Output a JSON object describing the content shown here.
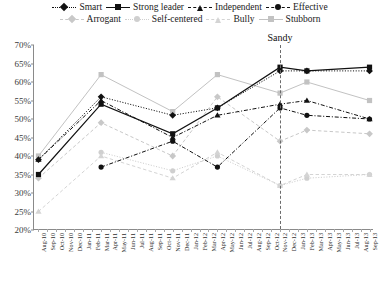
{
  "legend": {
    "rows": [
      [
        {
          "label": "Smart",
          "key": "smart"
        },
        {
          "label": "Strong leader",
          "key": "strong_leader"
        },
        {
          "label": "Independent",
          "key": "independent"
        },
        {
          "label": "Effective",
          "key": "effective"
        }
      ],
      [
        {
          "label": "Arrogant",
          "key": "arrogant"
        },
        {
          "label": "Self-centered",
          "key": "self_centered"
        },
        {
          "label": "Bully",
          "key": "bully"
        },
        {
          "label": "Stubborn",
          "key": "stubborn"
        }
      ]
    ]
  },
  "annotations": [
    {
      "name": "sandy-event",
      "label": "Sandy",
      "x_category": "Nov-12"
    }
  ],
  "chart_data": {
    "type": "line",
    "title": "",
    "xlabel": "",
    "ylabel": "",
    "ylim": [
      20,
      70
    ],
    "ytick_step": 5,
    "ytick_labels": [
      "20%",
      "25%",
      "30%",
      "35%",
      "40%",
      "45%",
      "50%",
      "55%",
      "60%",
      "65%",
      "70%"
    ],
    "grid": false,
    "legend_position": "top",
    "categories": [
      "Aug-10",
      "Sep-10",
      "Oct-10",
      "Nov-10",
      "Dec-10",
      "Jan-11",
      "Feb-11",
      "Mar-11",
      "Apr-11",
      "May-11",
      "Jun-11",
      "Jul-11",
      "Aug-11",
      "Sep-11",
      "Oct-11",
      "Nov-11",
      "Dec-11",
      "Jan-12",
      "Feb-12",
      "Mar-12",
      "Apr-12",
      "May-12",
      "Jun-12",
      "Jul-12",
      "Aug-12",
      "Sep-12",
      "Oct-12",
      "Nov-12",
      "Dec-12",
      "Jan-13",
      "Feb-13",
      "Mar-13",
      "Apr-13",
      "May-13",
      "Jun-13",
      "Jul-13",
      "Aug-13",
      "Sep-13"
    ],
    "series": [
      {
        "name": "Smart",
        "key": "smart",
        "color": "#111111",
        "marker": "diamond",
        "dash": "dotted",
        "width": 1,
        "points": [
          {
            "x": "Aug-10",
            "y": 39
          },
          {
            "x": "Mar-11",
            "y": 56
          },
          {
            "x": "Nov-11",
            "y": 51
          },
          {
            "x": "Apr-12",
            "y": 53
          },
          {
            "x": "Nov-12",
            "y": 63
          },
          {
            "x": "Feb-13",
            "y": 63
          },
          {
            "x": "Sep-13",
            "y": 63
          }
        ]
      },
      {
        "name": "Strong leader",
        "key": "strong_leader",
        "color": "#111111",
        "marker": "square",
        "dash": "solid",
        "width": 1.2,
        "points": [
          {
            "x": "Aug-10",
            "y": 35
          },
          {
            "x": "Mar-11",
            "y": 54
          },
          {
            "x": "Nov-11",
            "y": 46
          },
          {
            "x": "Apr-12",
            "y": 53
          },
          {
            "x": "Nov-12",
            "y": 64
          },
          {
            "x": "Feb-13",
            "y": 63
          },
          {
            "x": "Sep-13",
            "y": 64
          }
        ]
      },
      {
        "name": "Independent",
        "key": "independent",
        "color": "#111111",
        "marker": "triangle",
        "dash": "dashdot",
        "width": 1,
        "points": [
          {
            "x": "Aug-10",
            "y": 39
          },
          {
            "x": "Mar-11",
            "y": 55
          },
          {
            "x": "Nov-11",
            "y": 45
          },
          {
            "x": "Apr-12",
            "y": 51
          },
          {
            "x": "Nov-12",
            "y": 54
          },
          {
            "x": "Feb-13",
            "y": 55
          },
          {
            "x": "Sep-13",
            "y": 50
          }
        ]
      },
      {
        "name": "Effective",
        "key": "effective",
        "color": "#111111",
        "marker": "circle",
        "dash": "dashdot",
        "width": 1,
        "points": [
          {
            "x": "Mar-11",
            "y": 37
          },
          {
            "x": "Nov-11",
            "y": 44
          },
          {
            "x": "Apr-12",
            "y": 37
          },
          {
            "x": "Nov-12",
            "y": 53
          },
          {
            "x": "Feb-13",
            "y": 51
          },
          {
            "x": "Sep-13",
            "y": 50
          }
        ]
      },
      {
        "name": "Arrogant",
        "key": "arrogant",
        "color": "#c8c8c8",
        "marker": "diamond",
        "dash": "dashed",
        "width": 1,
        "points": [
          {
            "x": "Aug-10",
            "y": 34
          },
          {
            "x": "Mar-11",
            "y": 49
          },
          {
            "x": "Nov-11",
            "y": 40
          },
          {
            "x": "Apr-12",
            "y": 56
          },
          {
            "x": "Nov-12",
            "y": 44
          },
          {
            "x": "Feb-13",
            "y": 47
          },
          {
            "x": "Sep-13",
            "y": 46
          }
        ]
      },
      {
        "name": "Self-centered",
        "key": "self_centered",
        "color": "#cfcfcf",
        "marker": "circle",
        "dash": "dotted",
        "width": 1,
        "points": [
          {
            "x": "Mar-11",
            "y": 41
          },
          {
            "x": "Nov-11",
            "y": 36
          },
          {
            "x": "Apr-12",
            "y": 40
          },
          {
            "x": "Nov-12",
            "y": 32
          },
          {
            "x": "Feb-13",
            "y": 34
          },
          {
            "x": "Sep-13",
            "y": 35
          }
        ]
      },
      {
        "name": "Bully",
        "key": "bully",
        "color": "#d4d4d4",
        "marker": "triangle",
        "dash": "dashed",
        "width": 1,
        "points": [
          {
            "x": "Aug-10",
            "y": 25
          },
          {
            "x": "Mar-11",
            "y": 40
          },
          {
            "x": "Nov-11",
            "y": 34
          },
          {
            "x": "Apr-12",
            "y": 41
          },
          {
            "x": "Nov-12",
            "y": 32
          },
          {
            "x": "Feb-13",
            "y": 35
          },
          {
            "x": "Sep-13",
            "y": 35
          }
        ]
      },
      {
        "name": "Stubborn",
        "key": "stubborn",
        "color": "#c2c2c2",
        "marker": "square",
        "dash": "solid",
        "width": 1,
        "points": [
          {
            "x": "Aug-10",
            "y": 40
          },
          {
            "x": "Mar-11",
            "y": 62
          },
          {
            "x": "Nov-11",
            "y": 52
          },
          {
            "x": "Apr-12",
            "y": 62
          },
          {
            "x": "Nov-12",
            "y": 57
          },
          {
            "x": "Feb-13",
            "y": 60
          },
          {
            "x": "Sep-13",
            "y": 55
          }
        ]
      }
    ]
  }
}
